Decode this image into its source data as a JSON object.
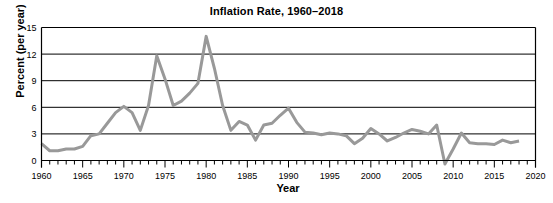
{
  "chart_data": {
    "type": "line",
    "title": "Inflation Rate, 1960–2018",
    "xlabel": "Year",
    "ylabel": "Percent (per year)",
    "xlim": [
      1960,
      2020
    ],
    "ylim": [
      0,
      15
    ],
    "y_axis_min_drawn": -1,
    "ytick_labels": [
      "0",
      "3",
      "6",
      "9",
      "12",
      "15"
    ],
    "ytick_values": [
      0,
      3,
      6,
      9,
      12,
      15
    ],
    "xtick_labels": [
      "1960",
      "1965",
      "1970",
      "1975",
      "1980",
      "1985",
      "1990",
      "1995",
      "2000",
      "2005",
      "2010",
      "2015",
      "2020"
    ],
    "xtick_values": [
      1960,
      1965,
      1970,
      1975,
      1980,
      1985,
      1990,
      1995,
      2000,
      2005,
      2010,
      2015,
      2020
    ],
    "minor_tick_interval": 1,
    "grid": "horizontal",
    "legend": "none",
    "line_color": "#999999",
    "line_width": 3,
    "axis_color": "#000000",
    "grid_color": "#000000",
    "x": [
      1960,
      1961,
      1962,
      1963,
      1964,
      1965,
      1966,
      1967,
      1968,
      1969,
      1970,
      1971,
      1972,
      1973,
      1974,
      1975,
      1976,
      1977,
      1978,
      1979,
      1980,
      1981,
      1982,
      1983,
      1984,
      1985,
      1986,
      1987,
      1988,
      1989,
      1990,
      1991,
      1992,
      1993,
      1994,
      1995,
      1996,
      1997,
      1998,
      1999,
      2000,
      2001,
      2002,
      2003,
      2004,
      2005,
      2006,
      2007,
      2008,
      2009,
      2010,
      2011,
      2012,
      2013,
      2014,
      2015,
      2016,
      2017,
      2018
    ],
    "values": [
      1.9,
      1.1,
      1.1,
      1.3,
      1.3,
      1.6,
      2.8,
      3.0,
      4.2,
      5.4,
      6.1,
      5.4,
      3.4,
      6.2,
      11.8,
      9.2,
      6.2,
      6.7,
      7.6,
      8.7,
      14.0,
      10.4,
      6.2,
      3.4,
      4.4,
      4.0,
      2.3,
      4.0,
      4.2,
      5.1,
      5.9,
      4.3,
      3.2,
      3.1,
      2.9,
      3.1,
      3.0,
      2.8,
      1.9,
      2.5,
      3.6,
      3.0,
      2.2,
      2.6,
      3.1,
      3.5,
      3.3,
      3.0,
      4.0,
      -0.4,
      1.3,
      3.1,
      2.0,
      1.9,
      1.9,
      1.8,
      2.3,
      2.0,
      2.2
    ]
  }
}
